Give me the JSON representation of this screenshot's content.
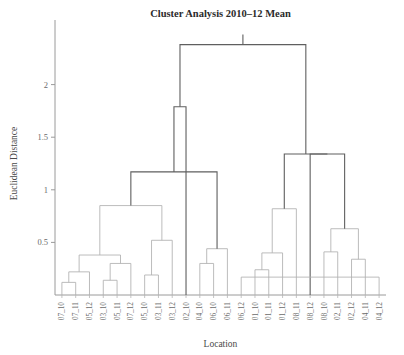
{
  "chart_data": {
    "type": "dendrogram",
    "title": "Cluster Analysis 2010–12 Mean",
    "xlabel": "Location",
    "ylabel": "Euclidean Distance",
    "ylim": [
      0,
      2.5
    ],
    "yticks": [
      0.5,
      1,
      1.5,
      2
    ],
    "ytick_labels": [
      "0.5",
      "1",
      "1.5",
      "2"
    ],
    "grid": false,
    "legend": null,
    "leaf_order": [
      "07_10",
      "07_11",
      "05_12",
      "03_10",
      "05_11",
      "07_12",
      "05_10",
      "03_11",
      "03_12",
      "02_10",
      "04_10",
      "06_10",
      "06_11",
      "06_12",
      "01_10",
      "01_11",
      "01_12",
      "08_11",
      "08_12",
      "08_10",
      "02_11",
      "02_12",
      "04_11",
      "04_12"
    ],
    "merges": [
      {
        "id": "m1",
        "left": "leaf:07_10",
        "right": "leaf:07_11",
        "height": 0.12
      },
      {
        "id": "m2",
        "left": "m1",
        "right": "leaf:05_12",
        "height": 0.22
      },
      {
        "id": "m3",
        "left": "leaf:03_10",
        "right": "leaf:05_11",
        "height": 0.14
      },
      {
        "id": "m4",
        "left": "m3",
        "right": "leaf:07_12",
        "height": 0.3
      },
      {
        "id": "m5",
        "left": "m2",
        "right": "m4",
        "height": 0.38
      },
      {
        "id": "m6",
        "left": "leaf:05_10",
        "right": "leaf:03_11",
        "height": 0.19
      },
      {
        "id": "m7",
        "left": "m6",
        "right": "leaf:03_12",
        "height": 0.52
      },
      {
        "id": "m8",
        "left": "m5",
        "right": "m7",
        "height": 0.85
      },
      {
        "id": "m9",
        "left": "leaf:04_10",
        "right": "leaf:06_10",
        "height": 0.3
      },
      {
        "id": "m10",
        "left": "m9",
        "right": "leaf:06_11",
        "height": 0.44
      },
      {
        "id": "m11",
        "left": "m8",
        "right": "m10",
        "height": 1.17
      },
      {
        "id": "m12",
        "left": "m11",
        "right": "leaf:02_10",
        "height": 1.79
      },
      {
        "id": "m13",
        "left": "leaf:01_10",
        "right": "leaf:01_11",
        "height": 0.24
      },
      {
        "id": "m14",
        "left": "m13",
        "right": "leaf:01_12",
        "height": 0.4
      },
      {
        "id": "m15",
        "left": "m14",
        "right": "leaf:08_11",
        "height": 0.82
      },
      {
        "id": "m16",
        "left": "leaf:08_10",
        "right": "leaf:02_11",
        "height": 0.41
      },
      {
        "id": "m17",
        "left": "leaf:02_12",
        "right": "leaf:04_11",
        "height": 0.34
      },
      {
        "id": "m18",
        "left": "m16",
        "right": "m17",
        "height": 0.63
      },
      {
        "id": "m19",
        "left": "m18",
        "right": "leaf:08_12",
        "height": 1.34
      },
      {
        "id": "m20",
        "left": "m15",
        "right": "m19",
        "height": 1.34
      },
      {
        "id": "m21",
        "left": "m12",
        "right": "m20",
        "height": 2.38
      },
      {
        "id": "m22",
        "left": "leaf:06_12",
        "right": "leaf:04_12",
        "height": 0.17
      }
    ],
    "link_color_dark": "#5f5f5f",
    "link_color_light": "#b0b0b0",
    "dark_threshold": 1.0
  },
  "plot": {
    "margin_left": 55,
    "margin_right": 18,
    "margin_top": 32,
    "margin_bottom": 60
  }
}
